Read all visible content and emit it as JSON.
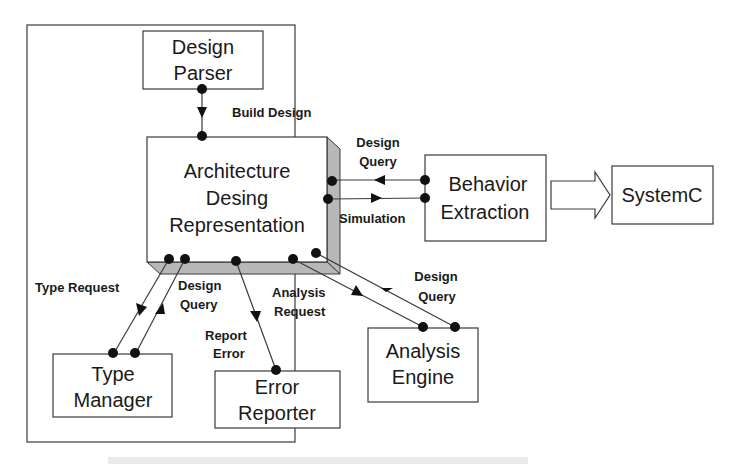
{
  "diagram": {
    "colors": {
      "stroke": "#3a3a3a",
      "box_fill": "#ffffff",
      "shadow_fill": "#b8b8b8",
      "dot": "#111111",
      "text": "#1a1a1a"
    },
    "nodes": {
      "design_parser": {
        "line1": "Design",
        "line2": "Parser"
      },
      "architecture": {
        "line1": "Architecture",
        "line2": "Desing",
        "line3": "Representation"
      },
      "behavior_extraction": {
        "line1": "Behavior",
        "line2": "Extraction"
      },
      "systemc": {
        "label": "SystemC"
      },
      "type_manager": {
        "line1": "Type",
        "line2": "Manager"
      },
      "error_reporter": {
        "line1": "Error",
        "line2": "Reporter"
      },
      "analysis_engine": {
        "line1": "Analysis",
        "line2": "Engine"
      }
    },
    "edges": {
      "build_design": {
        "label": "Build Design"
      },
      "behavior_design_query": {
        "line1": "Design",
        "line2": "Query"
      },
      "simulation": {
        "label": "Simulation"
      },
      "type_request": {
        "label": "Type Request"
      },
      "type_design_query": {
        "line1": "Design",
        "line2": "Query"
      },
      "report_error": {
        "line1": "Report",
        "line2": "Error"
      },
      "analysis_request": {
        "line1": "Analysis",
        "line2": "Request"
      },
      "analysis_design_query": {
        "line1": "Design",
        "line2": "Query"
      }
    }
  }
}
